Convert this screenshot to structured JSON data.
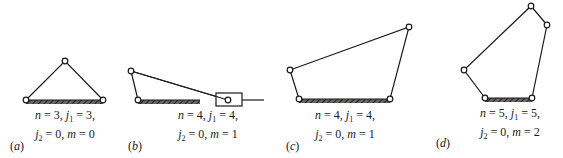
{
  "figures": [
    {
      "id": "a",
      "label": "a",
      "caption_line1": {
        "n": "3",
        "j1": "3"
      },
      "caption_line2": {
        "j2": "0",
        "m": "0"
      },
      "description": "Triangle linkage (structure), three pin joints, ground link hatched"
    },
    {
      "id": "b",
      "label": "b",
      "caption_line1": {
        "n": "4",
        "j1": "4"
      },
      "caption_line2": {
        "j2": "0",
        "m": "1"
      },
      "description": "Slider-crank mechanism with slider block on horizontal guide"
    },
    {
      "id": "c",
      "label": "c",
      "caption_line1": {
        "n": "4",
        "j1": "4"
      },
      "caption_line2": {
        "j2": "0",
        "m": "1"
      },
      "description": "Four-bar linkage with ground link hatched"
    },
    {
      "id": "d",
      "label": "d",
      "caption_line1": {
        "n": "5",
        "j1": "5"
      },
      "caption_line2": {
        "j2": "0",
        "m": "2"
      },
      "description": "Five-bar linkage with ground link hatched"
    }
  ],
  "colors": {
    "line": "#1a1a1a",
    "hatch": "#333333",
    "joint_fill": "#ffffff"
  }
}
